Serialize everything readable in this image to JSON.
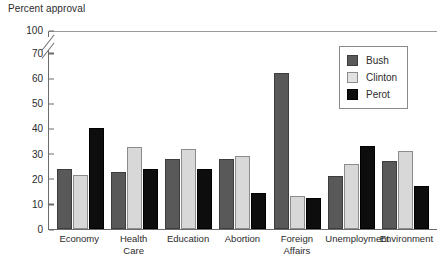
{
  "chart_data": {
    "type": "bar",
    "title": "",
    "ylabel": "Percent approval",
    "xlabel": "",
    "ylim": [
      0,
      100
    ],
    "y_axis_break": {
      "from": 70,
      "to": 100
    },
    "y_ticks": [
      0,
      10,
      20,
      30,
      40,
      50,
      60,
      70,
      100
    ],
    "grid": false,
    "legend_position": "top-right",
    "categories": [
      "Economy",
      "Health Care",
      "Education",
      "Abortion",
      "Foreign Affairs",
      "Unemployment",
      "Environment"
    ],
    "series": [
      {
        "name": "Bush",
        "color": "#595959",
        "values": [
          24,
          22.5,
          28,
          28,
          62,
          21,
          27
        ]
      },
      {
        "name": "Clinton",
        "color": "#d8d8d8",
        "values": [
          21.5,
          32.5,
          32,
          29,
          13,
          26,
          31
        ]
      },
      {
        "name": "Perot",
        "color": "#0d0d0d",
        "values": [
          40,
          24,
          24,
          14.5,
          12.5,
          33,
          17
        ]
      }
    ]
  },
  "axis": {
    "title": "Percent approval",
    "tick_labels": [
      "100",
      "70",
      "60",
      "50",
      "40",
      "30",
      "20",
      "10",
      "0"
    ]
  },
  "legend": {
    "entries": [
      {
        "label": "Bush"
      },
      {
        "label": "Clinton"
      },
      {
        "label": "Perot"
      }
    ]
  },
  "xlabels": [
    "Economy",
    "Health\nCare",
    "Education",
    "Abortion",
    "Foreign\nAffairs",
    "Unemployment",
    "Environment"
  ]
}
